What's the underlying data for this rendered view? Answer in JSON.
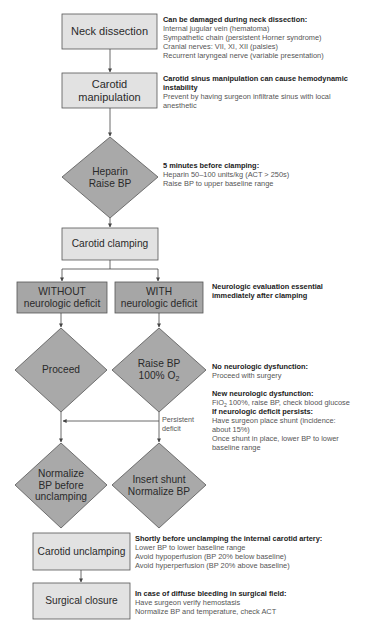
{
  "colors": {
    "light_box_fill": "#e2e2e2",
    "dark_box_fill": "#a6a6a6",
    "diamond_fill": "#a9a9a9",
    "stroke": "#555555",
    "heading_text": "#222222",
    "body_text": "#555555"
  },
  "nodes": {
    "neck_dissection": {
      "label": "Neck dissection"
    },
    "carotid_manipulation": {
      "line1": "Carotid",
      "line2": "manipulation"
    },
    "heparin": {
      "line1": "Heparin",
      "line2": "Raise BP"
    },
    "carotid_clamping": {
      "label": "Carotid clamping"
    },
    "without_deficit": {
      "line1": "WITHOUT",
      "line2": "neurologic deficit"
    },
    "with_deficit": {
      "line1": "WITH",
      "line2": "neurologic deficit"
    },
    "proceed": {
      "label": "Proceed"
    },
    "raise_bp": {
      "line1": "Raise BP",
      "line2_prefix": "100% O",
      "line2_sub": "2"
    },
    "normalize_bp": {
      "line1": "Normalize",
      "line2": "BP before",
      "line3": "unclamping"
    },
    "insert_shunt": {
      "line1": "Insert shunt",
      "line2": "Normalize BP"
    },
    "carotid_unclamping": {
      "label": "Carotid unclamping"
    },
    "surgical_closure": {
      "label": "Surgical closure"
    }
  },
  "edge_labels": {
    "persistent_deficit": {
      "line1": "Persistent",
      "line2": "deficit"
    }
  },
  "notes": {
    "neck_dissection": {
      "heading": "Can be damaged during neck dissection:",
      "lines": [
        "Internal jugular vein (hematoma)",
        "Sympathetic chain (persistent Horner syndrome)",
        "Cranial nerves: VII, XI, XII (palsies)",
        "Recurrent laryngeal nerve (variable presentation)"
      ]
    },
    "carotid_manipulation": {
      "heading_line1": "Carotid sinus manipulation can cause hemodynamic",
      "heading_line2": "instability",
      "lines": [
        "Prevent by having surgeon infiltrate sinus with local",
        "anesthetic"
      ]
    },
    "heparin": {
      "heading": "5 minutes before clamping:",
      "lines": [
        "Heparin 50–100 units/kg (ACT > 250s)",
        "Raise BP to upper baseline range"
      ]
    },
    "clamping": {
      "heading_line1": "Neurologic evaluation essential",
      "heading_line2": "immediately after clamping"
    },
    "no_dysfunction": {
      "heading": "No neurologic dysfunction:",
      "lines": [
        "Proceed with surgery"
      ]
    },
    "new_dysfunction": {
      "heading": "New neurologic dysfunction:",
      "line1_prefix": "FiO",
      "line1_sub": "2",
      "line1_suffix": " 100%, raise BP, check blood glucose",
      "heading2": "If neurologic deficit persists:",
      "lines": [
        "Have surgeon place shunt (incidence:",
        "about 15%)",
        "Once shunt in place, lower BP to lower",
        "baseline range"
      ]
    },
    "unclamping": {
      "heading": "Shortly before unclamping the internal carotid artery:",
      "lines": [
        "Lower BP to lower baseline range",
        "Avoid hypoperfusion (BP 20% below baseline)",
        "Avoid hyperperfusion (BP 20% above baseline)"
      ]
    },
    "closure": {
      "heading": "In case of diffuse bleeding in surgical field:",
      "lines": [
        "Have surgeon verify hemostasis",
        "Normalize BP and temperature, check ACT"
      ]
    }
  }
}
